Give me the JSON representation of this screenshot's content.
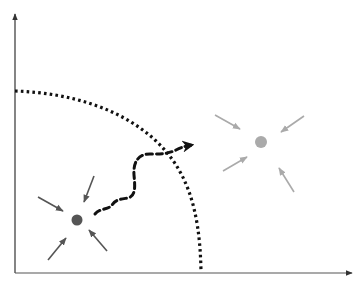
{
  "diagram": {
    "type": "phase-space-schematic",
    "axes": {
      "x_axis": {
        "label": "",
        "color": "#555555"
      },
      "y_axis": {
        "label": "",
        "color": "#333333"
      }
    },
    "boundary": {
      "style": "dotted",
      "shape": "quarter-arc",
      "color": "#111111"
    },
    "attractors": [
      {
        "name": "initial-state",
        "color": "#555555",
        "arrow_color": "#555555",
        "inward_arrows": 4
      },
      {
        "name": "target-state",
        "color": "#aaaaaa",
        "arrow_color": "#aaaaaa",
        "inward_arrows": 4
      }
    ],
    "transition_path": {
      "style": "dashed",
      "color": "#111111",
      "from": "initial-state",
      "to": "target-state",
      "crosses_boundary": true
    },
    "colors": {
      "background": "#ffffff",
      "axis": "#444444",
      "dark_state": "#555555",
      "light_state": "#aaaaaa",
      "ink": "#111111"
    }
  }
}
